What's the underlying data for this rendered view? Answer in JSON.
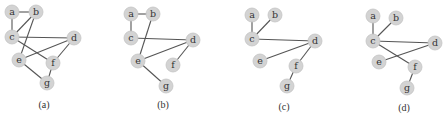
{
  "figure": {
    "node_fill": "#d3d3d3",
    "edge_color": "#555555",
    "panels": [
      {
        "caption": "(a)",
        "caption_pos": [
          44,
          108
        ],
        "nodes": [
          {
            "id": "a",
            "x": 12,
            "y": 12
          },
          {
            "id": "b",
            "x": 36,
            "y": 12
          },
          {
            "id": "c",
            "x": 12,
            "y": 37
          },
          {
            "id": "d",
            "x": 74,
            "y": 38
          },
          {
            "id": "e",
            "x": 19,
            "y": 60
          },
          {
            "id": "f",
            "x": 53,
            "y": 63
          },
          {
            "id": "g",
            "x": 47,
            "y": 83
          }
        ],
        "edges": [
          [
            "a",
            "b"
          ],
          [
            "a",
            "c"
          ],
          [
            "b",
            "c"
          ],
          [
            "b",
            "e"
          ],
          [
            "c",
            "d"
          ],
          [
            "c",
            "f"
          ],
          [
            "e",
            "d"
          ],
          [
            "d",
            "f"
          ],
          [
            "e",
            "g"
          ],
          [
            "f",
            "g"
          ]
        ]
      },
      {
        "caption": "(b)",
        "caption_pos": [
          163,
          108
        ],
        "nodes": [
          {
            "id": "a",
            "x": 131,
            "y": 14
          },
          {
            "id": "b",
            "x": 153,
            "y": 14
          },
          {
            "id": "c",
            "x": 131,
            "y": 38
          },
          {
            "id": "d",
            "x": 193,
            "y": 40
          },
          {
            "id": "e",
            "x": 138,
            "y": 61
          },
          {
            "id": "f",
            "x": 173,
            "y": 65
          },
          {
            "id": "g",
            "x": 166,
            "y": 86
          }
        ],
        "edges": [
          [
            "a",
            "b"
          ],
          [
            "a",
            "c"
          ],
          [
            "b",
            "e"
          ],
          [
            "c",
            "d"
          ],
          [
            "e",
            "d"
          ],
          [
            "d",
            "f"
          ],
          [
            "e",
            "g"
          ]
        ]
      },
      {
        "caption": "(c)",
        "caption_pos": [
          284,
          110
        ],
        "nodes": [
          {
            "id": "a",
            "x": 252,
            "y": 15
          },
          {
            "id": "b",
            "x": 275,
            "y": 15
          },
          {
            "id": "c",
            "x": 252,
            "y": 39
          },
          {
            "id": "d",
            "x": 315,
            "y": 41
          },
          {
            "id": "e",
            "x": 260,
            "y": 61
          },
          {
            "id": "f",
            "x": 296,
            "y": 66
          },
          {
            "id": "g",
            "x": 287,
            "y": 86
          }
        ],
        "edges": [
          [
            "a",
            "c"
          ],
          [
            "b",
            "c"
          ],
          [
            "c",
            "d"
          ],
          [
            "e",
            "d"
          ],
          [
            "d",
            "f"
          ],
          [
            "f",
            "g"
          ]
        ]
      },
      {
        "caption": "(d)",
        "caption_pos": [
          404,
          111
        ],
        "nodes": [
          {
            "id": "a",
            "x": 373,
            "y": 16
          },
          {
            "id": "b",
            "x": 396,
            "y": 18
          },
          {
            "id": "c",
            "x": 373,
            "y": 41
          },
          {
            "id": "d",
            "x": 435,
            "y": 43
          },
          {
            "id": "e",
            "x": 379,
            "y": 62
          },
          {
            "id": "f",
            "x": 415,
            "y": 67
          },
          {
            "id": "g",
            "x": 407,
            "y": 88
          }
        ],
        "edges": [
          [
            "a",
            "c"
          ],
          [
            "b",
            "c"
          ],
          [
            "c",
            "d"
          ],
          [
            "c",
            "f"
          ],
          [
            "e",
            "d"
          ],
          [
            "f",
            "g"
          ]
        ]
      }
    ]
  }
}
